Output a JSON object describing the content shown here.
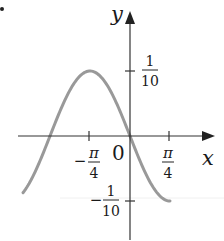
{
  "figure": {
    "bullet": "•",
    "function": "y = -(1/10) sin(2x)",
    "axes": {
      "x_label": "x",
      "y_label": "y",
      "origin_label": "0"
    },
    "x_ticks": [
      {
        "sign": "−",
        "num": "π",
        "den": "4",
        "value": -0.7854
      },
      {
        "sign": "",
        "num": "π",
        "den": "4",
        "value": 0.7854
      }
    ],
    "y_ticks": [
      {
        "sign": "",
        "num": "1",
        "den": "10",
        "value": 0.1
      },
      {
        "sign": "−",
        "num": "1",
        "den": "10",
        "value": -0.1
      }
    ],
    "colors": {
      "curve": "#999999",
      "axis": "#333333",
      "text": "#1a1a1a"
    }
  },
  "chart_data": {
    "type": "line",
    "title": "",
    "xlabel": "x",
    "ylabel": "y",
    "series": [
      {
        "name": "y = -0.1 sin(2x)",
        "x": [
          -2.1,
          -1.5708,
          -1.1781,
          -0.7854,
          -0.3927,
          0,
          0.3927,
          0.7854
        ],
        "y": [
          -0.087,
          0.0,
          0.0707,
          0.1,
          0.0707,
          0.0,
          -0.0707,
          -0.1
        ]
      }
    ],
    "x_ticks": [
      "−π/4",
      "π/4"
    ],
    "y_ticks": [
      "1/10",
      "−1/10"
    ],
    "xlim": [
      -2.3,
      1.5
    ],
    "ylim": [
      -0.15,
      0.17
    ],
    "grid": false
  }
}
